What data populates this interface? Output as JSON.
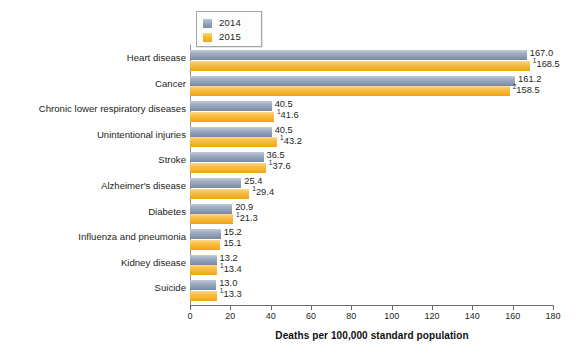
{
  "chart_data": {
    "type": "bar",
    "orientation": "horizontal",
    "title": "",
    "xlabel": "Deaths per 100,000 standard population",
    "ylabel": "",
    "xlim": [
      0,
      180
    ],
    "xticks": [
      0,
      20,
      40,
      60,
      80,
      100,
      120,
      140,
      160,
      180
    ],
    "grid": false,
    "legend_position": "top-left",
    "categories": [
      "Heart disease",
      "Cancer",
      "Chronic lower respiratory diseases",
      "Unintentional injuries",
      "Stroke",
      "Alzheimer's disease",
      "Diabetes",
      "Influenza and pneumonia",
      "Kidney disease",
      "Suicide"
    ],
    "series": [
      {
        "name": "2014",
        "color": "#8a9ab2",
        "values": [
          167.0,
          161.2,
          40.5,
          40.5,
          36.5,
          25.4,
          20.9,
          15.2,
          13.2,
          13.0
        ],
        "labels": [
          "167.0",
          "161.2",
          "40.5",
          "40.5",
          "36.5",
          "25.4",
          "20.9",
          "15.2",
          "13.2",
          "13.0"
        ],
        "label_marks": [
          "",
          "",
          "",
          "",
          "",
          "",
          "",
          "",
          "",
          ""
        ]
      },
      {
        "name": "2015",
        "color": "#f5b12a",
        "values": [
          168.5,
          158.5,
          41.6,
          43.2,
          37.6,
          29.4,
          21.3,
          15.1,
          13.4,
          13.3
        ],
        "labels": [
          "168.5",
          "158.5",
          "41.6",
          "43.2",
          "37.6",
          "29.4",
          "21.3",
          "15.1",
          "13.4",
          "13.3"
        ],
        "label_marks": [
          "1",
          "2",
          "1",
          "1",
          "1",
          "1",
          "1",
          "",
          "1",
          "1"
        ]
      }
    ]
  },
  "legend": {
    "items": [
      {
        "label": "2014",
        "swatch": "blue"
      },
      {
        "label": "2015",
        "swatch": "orange"
      }
    ]
  },
  "axis": {
    "x_title": "Deaths per 100,000 standard population",
    "x_tick_labels": [
      "0",
      "20",
      "40",
      "60",
      "80",
      "100",
      "120",
      "140",
      "160",
      "180"
    ]
  },
  "caption": {
    "cropped_line": "                                                                                                                                                      "
  }
}
